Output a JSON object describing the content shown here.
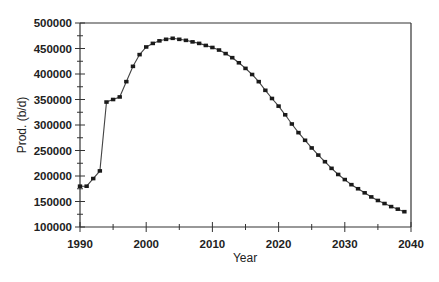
{
  "chart_data": {
    "type": "line",
    "title": "",
    "xlabel": "Year",
    "ylabel": "Prod. (b/d)",
    "xlim": [
      1990,
      2040
    ],
    "ylim": [
      100000,
      500000
    ],
    "x_ticks": [
      1990,
      2000,
      2010,
      2020,
      2030,
      2040
    ],
    "x_tick_labels": [
      "1990",
      "2000",
      "2010",
      "2020",
      "2030",
      "2040"
    ],
    "y_ticks": [
      100000,
      150000,
      200000,
      250000,
      300000,
      350000,
      400000,
      450000,
      500000
    ],
    "y_tick_labels": [
      "100000",
      "150000",
      "200000",
      "250000",
      "300000",
      "350000",
      "400000",
      "450000",
      "500000"
    ],
    "grid": false,
    "legend": null,
    "series": [
      {
        "name": "Production",
        "marker": "square",
        "color": "#1a1a1a",
        "x": [
          1990,
          1991,
          1992,
          1993,
          1994,
          1995,
          1996,
          1997,
          1998,
          1999,
          2000,
          2001,
          2002,
          2003,
          2004,
          2005,
          2006,
          2007,
          2008,
          2009,
          2010,
          2011,
          2012,
          2013,
          2014,
          2015,
          2016,
          2017,
          2018,
          2019,
          2020,
          2021,
          2022,
          2023,
          2024,
          2025,
          2026,
          2027,
          2028,
          2029,
          2030,
          2031,
          2032,
          2033,
          2034,
          2035,
          2036,
          2037,
          2038,
          2039
        ],
        "values": [
          180000,
          180000,
          195000,
          210000,
          345000,
          350000,
          355000,
          385000,
          415000,
          438000,
          453000,
          460000,
          465000,
          468000,
          470000,
          468000,
          466000,
          463000,
          460000,
          456000,
          452000,
          447000,
          440000,
          432000,
          422000,
          411000,
          399000,
          385000,
          368000,
          352000,
          337000,
          320000,
          302000,
          285000,
          270000,
          255000,
          241000,
          228000,
          215000,
          203000,
          193000,
          183000,
          175000,
          167000,
          159000,
          152000,
          146000,
          140000,
          135000,
          130000
        ]
      }
    ]
  }
}
